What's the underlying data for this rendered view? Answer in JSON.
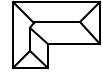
{
  "diagram": {
    "type": "roof-plan",
    "shape": "L-shaped hip roof",
    "stroke_color": "#000000",
    "background_color": "#ffffff",
    "stroke_width": 2
  }
}
